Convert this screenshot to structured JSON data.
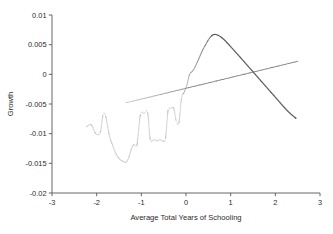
{
  "chart_data": {
    "type": "line",
    "title": "",
    "subtitle": "",
    "xlabel": "Average Total Years of Schooling",
    "ylabel": "Growth",
    "xlim": [
      -3,
      3
    ],
    "ylim": [
      -0.02,
      0.01
    ],
    "grid": false,
    "legend": null,
    "x_ticks": [
      -3,
      -2,
      -1,
      0,
      1,
      2,
      3
    ],
    "x_tick_labels": [
      "-3",
      "-2",
      "-1",
      "0",
      "1",
      "2",
      "3"
    ],
    "y_ticks": [
      0.01,
      0.005,
      0,
      -0.005,
      -0.01,
      -0.015,
      -0.02
    ],
    "y_tick_labels": [
      "0.01",
      "0.005",
      "0",
      "-0.005",
      "-0.01",
      "-0.015",
      "-0.02"
    ],
    "series": [
      {
        "name": "nonparametric-fit",
        "style": "dotted-curve",
        "color": "#4a4a4a",
        "points": [
          [
            -2.22,
            -0.0088
          ],
          [
            -2.12,
            -0.0085
          ],
          [
            -2.02,
            -0.01
          ],
          [
            -1.92,
            -0.0098
          ],
          [
            -1.86,
            -0.0069
          ],
          [
            -1.8,
            -0.007
          ],
          [
            -1.72,
            -0.0102
          ],
          [
            -1.64,
            -0.012
          ],
          [
            -1.56,
            -0.0135
          ],
          [
            -1.48,
            -0.0143
          ],
          [
            -1.4,
            -0.0147
          ],
          [
            -1.34,
            -0.0148
          ],
          [
            -1.28,
            -0.014
          ],
          [
            -1.22,
            -0.0125
          ],
          [
            -1.16,
            -0.0118
          ],
          [
            -1.1,
            -0.012
          ],
          [
            -1.02,
            -0.0068
          ],
          [
            -0.94,
            -0.0066
          ],
          [
            -0.86,
            -0.0064
          ],
          [
            -0.8,
            -0.011
          ],
          [
            -0.72,
            -0.011
          ],
          [
            -0.64,
            -0.0112
          ],
          [
            -0.58,
            -0.011
          ],
          [
            -0.52,
            -0.0112
          ],
          [
            -0.46,
            -0.0108
          ],
          [
            -0.4,
            -0.006
          ],
          [
            -0.34,
            -0.0058
          ],
          [
            -0.28,
            -0.0056
          ],
          [
            -0.22,
            -0.0078
          ],
          [
            -0.16,
            -0.0082
          ],
          [
            -0.1,
            -0.004
          ],
          [
            -0.04,
            -0.003
          ],
          [
            0.02,
            -0.0018
          ],
          [
            0.08,
            0.0
          ],
          [
            0.14,
            0.0005
          ],
          [
            0.2,
            0.0012
          ],
          [
            0.26,
            0.0022
          ],
          [
            0.32,
            0.0032
          ],
          [
            0.38,
            0.0042
          ],
          [
            0.44,
            0.005
          ],
          [
            0.5,
            0.0058
          ],
          [
            0.56,
            0.0064
          ],
          [
            0.62,
            0.0067
          ],
          [
            0.68,
            0.0067
          ],
          [
            0.76,
            0.0064
          ],
          [
            0.86,
            0.0058
          ],
          [
            0.96,
            0.005
          ],
          [
            1.08,
            0.004
          ],
          [
            1.2,
            0.003
          ],
          [
            1.34,
            0.0018
          ],
          [
            1.48,
            0.0006
          ],
          [
            1.62,
            -0.0006
          ],
          [
            1.76,
            -0.0018
          ],
          [
            1.9,
            -0.003
          ],
          [
            2.04,
            -0.0042
          ],
          [
            2.18,
            -0.0054
          ],
          [
            2.32,
            -0.0065
          ],
          [
            2.46,
            -0.0074
          ]
        ]
      },
      {
        "name": "linear-fit",
        "style": "straight-line",
        "color": "#6b6b6b",
        "points": [
          [
            -1.35,
            -0.0048
          ],
          [
            2.5,
            0.0022
          ]
        ]
      }
    ],
    "annotations": []
  },
  "axes": {
    "ylabel": "Growth",
    "xlabel": "Average Total Years of Schooling"
  }
}
